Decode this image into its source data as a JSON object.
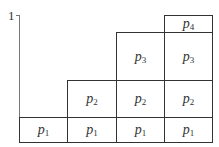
{
  "diagram": {
    "y_axis_label": "1",
    "columns": [
      {
        "index": 0,
        "stack": [
          "p1"
        ]
      },
      {
        "index": 1,
        "stack": [
          "p1",
          "p2"
        ]
      },
      {
        "index": 2,
        "stack": [
          "p1",
          "p2",
          "p3"
        ]
      },
      {
        "index": 3,
        "stack": [
          "p1",
          "p2",
          "p3",
          "p4"
        ]
      }
    ],
    "cells": [
      {
        "label": "p",
        "sub": "1",
        "col": 0,
        "row": 0
      },
      {
        "label": "p",
        "sub": "1",
        "col": 1,
        "row": 0
      },
      {
        "label": "p",
        "sub": "1",
        "col": 2,
        "row": 0
      },
      {
        "label": "p",
        "sub": "1",
        "col": 3,
        "row": 0
      },
      {
        "label": "p",
        "sub": "2",
        "col": 1,
        "row": 1
      },
      {
        "label": "p",
        "sub": "2",
        "col": 2,
        "row": 1
      },
      {
        "label": "p",
        "sub": "2",
        "col": 3,
        "row": 1
      },
      {
        "label": "p",
        "sub": "3",
        "col": 2,
        "row": 2
      },
      {
        "label": "p",
        "sub": "3",
        "col": 3,
        "row": 2
      },
      {
        "label": "p",
        "sub": "4",
        "col": 3,
        "row": 3
      }
    ]
  }
}
